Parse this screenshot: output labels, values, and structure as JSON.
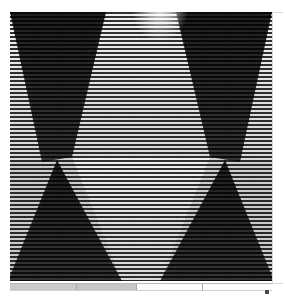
{
  "app": {
    "title": "Scanline Pattern Viewer",
    "background_color": "#ffffff"
  },
  "image_panel": {
    "name": "scanline-triangle-pattern",
    "description": "Horizontally scanlined grayscale image of alternating light and dark triangles forming an hourglass lattice",
    "width_px": 262,
    "height_px": 269,
    "left_px": 10,
    "top_px": 12,
    "scanline_period_px": 4,
    "scanline_color": "#000000",
    "light_color": "#e8e8e8",
    "mid_color": "#bdbdbd",
    "dark_color": "#2a2a2a",
    "shapes": [
      {
        "id": "dark-top-left",
        "label": "dark downward triangle, upper left",
        "fill": "#242424"
      },
      {
        "id": "light-center",
        "label": "light downward wedge, upper centre",
        "fill": "#ececec"
      },
      {
        "id": "dark-top-right",
        "label": "dark downward triangle, upper right",
        "fill": "#242424"
      },
      {
        "id": "light-left-edge",
        "label": "light triangle, left edge",
        "fill": "#d8d8d8"
      },
      {
        "id": "light-right-edge",
        "label": "light triangle, right edge",
        "fill": "#d8d8d8"
      },
      {
        "id": "dark-bottom-left",
        "label": "dark upward triangle, lower left",
        "fill": "#242424"
      },
      {
        "id": "dark-bottom-right",
        "label": "dark upward triangle, lower right",
        "fill": "#242424"
      },
      {
        "id": "light-bottom-center",
        "label": "light upward wedge, lower centre",
        "fill": "#ececec"
      }
    ]
  },
  "bottom_bar": {
    "name": "horizontal-segment-bar",
    "segments": [
      {
        "id": "segment-1",
        "width_px": 67,
        "fill": "#cacaca"
      },
      {
        "id": "segment-2",
        "width_px": 60,
        "fill": "#c6c6c6"
      },
      {
        "id": "segment-3",
        "width_px": 66,
        "fill": "#fdfdfd"
      },
      {
        "id": "segment-4",
        "width_px": 69,
        "fill": "#fdfdfd"
      }
    ]
  },
  "side_panel": {
    "name": "right-side-panel",
    "border_color": "#dadada",
    "fill": "#ffffff"
  },
  "corner_glyph": {
    "name": "corner-marker",
    "label": ""
  }
}
